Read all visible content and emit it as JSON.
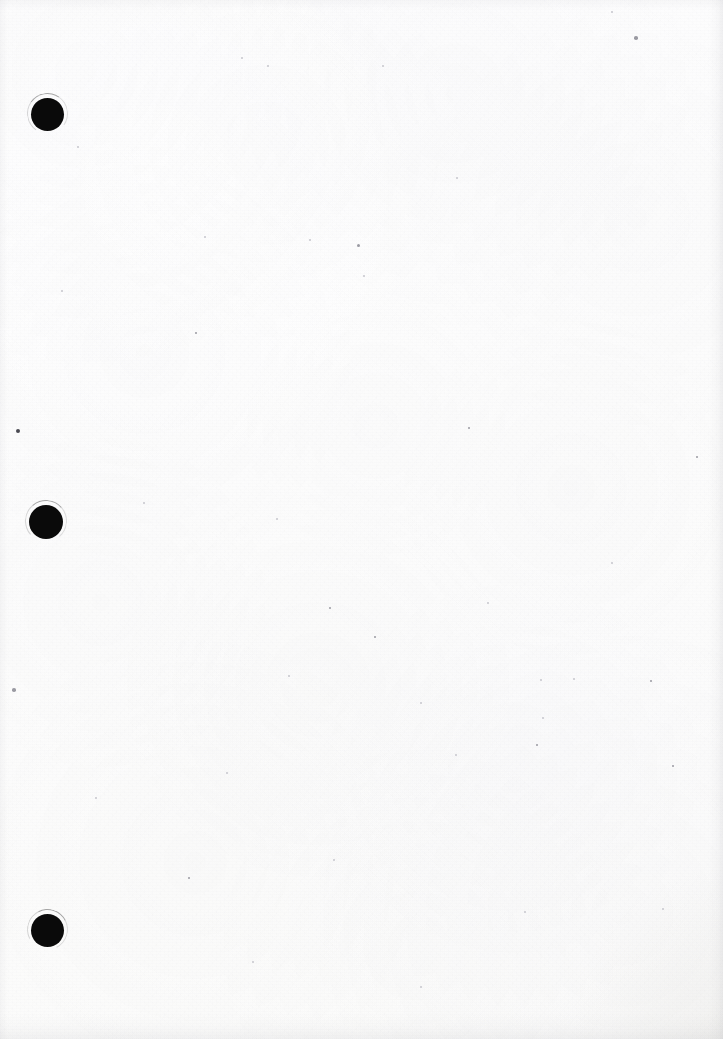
{
  "document": {
    "kind": "scanned-blank-page",
    "title": "Scanned blank page",
    "description": "A blank, three-hole-punched sheet of white paper captured by a flatbed scanner. No printed or handwritten content is visible.",
    "page_width": 723,
    "page_height": 1039,
    "orientation": "portrait",
    "content_text": "",
    "paper": {
      "base_color": "#fdfdfd",
      "tint_color": "#fbfbfa",
      "grain_color": "#a0a0a8",
      "texture": "fine uncoated paper grain with faint mottling"
    },
    "edges": {
      "right_shadow_color": "#96969e",
      "bottom_shadow_color": "#96969e",
      "corner_shadow_color": "#a5a29b"
    }
  },
  "punch_holes": {
    "count": 3,
    "alignment": "left margin, vertically spaced",
    "fill_color": "#0a0a0a",
    "halo_color": "#3c3c3c",
    "items": [
      {
        "label": "top-punch-hole",
        "cx": 47,
        "cy": 114,
        "r": 16.5,
        "fiber": true
      },
      {
        "label": "middle-punch-hole",
        "cx": 46,
        "cy": 522,
        "r": 17.0,
        "fiber": true
      },
      {
        "label": "bottom-punch-hole",
        "cx": 47,
        "cy": 930,
        "r": 16.5,
        "fiber": true
      }
    ]
  },
  "artifacts": {
    "label": "scanner dust and paper specks",
    "speck_color": "#9a9aa2",
    "speck_color_dark": "#4a4a52",
    "speck_color_faint": "#c6c6cc",
    "specks": [
      {
        "x": 18,
        "y": 431,
        "r": 2.4,
        "tone": "dark"
      },
      {
        "x": 14,
        "y": 690,
        "r": 1.8,
        "tone": "normal"
      },
      {
        "x": 636,
        "y": 38,
        "r": 1.8,
        "tone": "normal"
      },
      {
        "x": 612,
        "y": 12,
        "r": 1.4,
        "tone": "faint"
      },
      {
        "x": 196,
        "y": 333,
        "r": 1.3,
        "tone": "normal"
      },
      {
        "x": 242,
        "y": 58,
        "r": 1.2,
        "tone": "faint"
      },
      {
        "x": 268,
        "y": 66,
        "r": 1.1,
        "tone": "faint"
      },
      {
        "x": 383,
        "y": 66,
        "r": 1.2,
        "tone": "faint"
      },
      {
        "x": 358,
        "y": 245,
        "r": 1.5,
        "tone": "normal"
      },
      {
        "x": 364,
        "y": 276,
        "r": 1.2,
        "tone": "faint"
      },
      {
        "x": 62,
        "y": 291,
        "r": 1.2,
        "tone": "faint"
      },
      {
        "x": 310,
        "y": 240,
        "r": 1.1,
        "tone": "faint"
      },
      {
        "x": 469,
        "y": 428,
        "r": 1.3,
        "tone": "normal"
      },
      {
        "x": 330,
        "y": 608,
        "r": 1.4,
        "tone": "normal"
      },
      {
        "x": 375,
        "y": 637,
        "r": 1.3,
        "tone": "normal"
      },
      {
        "x": 289,
        "y": 676,
        "r": 1.2,
        "tone": "faint"
      },
      {
        "x": 541,
        "y": 680,
        "r": 1.2,
        "tone": "faint"
      },
      {
        "x": 651,
        "y": 681,
        "r": 1.3,
        "tone": "normal"
      },
      {
        "x": 543,
        "y": 718,
        "r": 1.2,
        "tone": "faint"
      },
      {
        "x": 537,
        "y": 745,
        "r": 1.3,
        "tone": "normal"
      },
      {
        "x": 456,
        "y": 755,
        "r": 1.2,
        "tone": "faint"
      },
      {
        "x": 189,
        "y": 878,
        "r": 1.3,
        "tone": "normal"
      },
      {
        "x": 525,
        "y": 912,
        "r": 1.2,
        "tone": "faint"
      },
      {
        "x": 144,
        "y": 503,
        "r": 1.2,
        "tone": "faint"
      },
      {
        "x": 277,
        "y": 519,
        "r": 1.1,
        "tone": "faint"
      },
      {
        "x": 697,
        "y": 457,
        "r": 1.3,
        "tone": "normal"
      },
      {
        "x": 673,
        "y": 766,
        "r": 1.3,
        "tone": "normal"
      },
      {
        "x": 574,
        "y": 679,
        "r": 1.1,
        "tone": "faint"
      },
      {
        "x": 421,
        "y": 703,
        "r": 1.2,
        "tone": "faint"
      },
      {
        "x": 96,
        "y": 798,
        "r": 1.2,
        "tone": "faint"
      },
      {
        "x": 227,
        "y": 773,
        "r": 1.1,
        "tone": "faint"
      },
      {
        "x": 488,
        "y": 603,
        "r": 1.1,
        "tone": "faint"
      },
      {
        "x": 663,
        "y": 909,
        "r": 1.2,
        "tone": "faint"
      },
      {
        "x": 205,
        "y": 237,
        "r": 1.1,
        "tone": "faint"
      },
      {
        "x": 457,
        "y": 178,
        "r": 1.1,
        "tone": "faint"
      },
      {
        "x": 78,
        "y": 147,
        "r": 1.1,
        "tone": "faint"
      },
      {
        "x": 334,
        "y": 860,
        "r": 1.1,
        "tone": "faint"
      },
      {
        "x": 612,
        "y": 563,
        "r": 1.2,
        "tone": "faint"
      },
      {
        "x": 253,
        "y": 962,
        "r": 1.1,
        "tone": "faint"
      },
      {
        "x": 421,
        "y": 987,
        "r": 1.1,
        "tone": "faint"
      }
    ]
  }
}
